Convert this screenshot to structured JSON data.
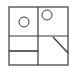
{
  "diagram": {
    "stroke_color": "#3a3a3a",
    "background": "#ffffff",
    "outer_box": {
      "x": 9,
      "y": 7,
      "width": 59,
      "height": 58
    },
    "dividers": {
      "vertical_x": 38,
      "horizontal_y": 36,
      "bottom_left_shelf_y": 51
    },
    "circles": [
      {
        "name": "left-circle",
        "cx": 24,
        "cy": 22,
        "r": 5
      },
      {
        "name": "right-circle",
        "cx": 47,
        "cy": 15,
        "r": 5
      }
    ],
    "diagonal": {
      "x1": 53,
      "y1": 37,
      "x2": 68,
      "y2": 53
    }
  }
}
